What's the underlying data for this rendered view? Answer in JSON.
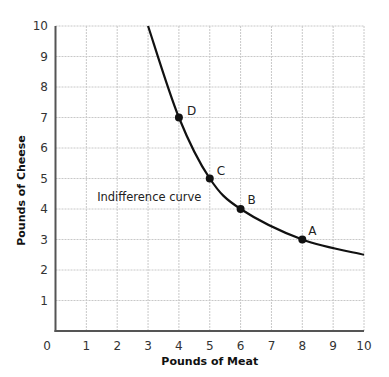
{
  "chart_data": {
    "type": "line",
    "title": "",
    "xlabel": "Pounds of Meat",
    "ylabel": "Pounds of Cheese",
    "xlim": [
      0,
      10
    ],
    "ylim": [
      0,
      10
    ],
    "grid": true,
    "x_ticks": [
      "0",
      "1",
      "2",
      "3",
      "4",
      "5",
      "6",
      "7",
      "8",
      "9",
      "10"
    ],
    "y_ticks": [
      "1",
      "2",
      "3",
      "4",
      "5",
      "6",
      "7",
      "8",
      "9",
      "10"
    ],
    "series": [
      {
        "name": "Indifference curve",
        "x": [
          3,
          4,
          5,
          6,
          8,
          10
        ],
        "y": [
          10,
          7,
          5,
          4,
          3,
          2.5
        ]
      }
    ],
    "points": [
      {
        "label": "D",
        "x": 4,
        "y": 7
      },
      {
        "label": "C",
        "x": 5,
        "y": 5
      },
      {
        "label": "B",
        "x": 6,
        "y": 4
      },
      {
        "label": "A",
        "x": 8,
        "y": 3
      }
    ],
    "annotations": [
      {
        "text": "Indifference curve",
        "x": 1.35,
        "y": 4.4
      }
    ]
  },
  "colors": {
    "grid": "#c8c8c8",
    "axis": "#555555",
    "curve": "#111111"
  }
}
